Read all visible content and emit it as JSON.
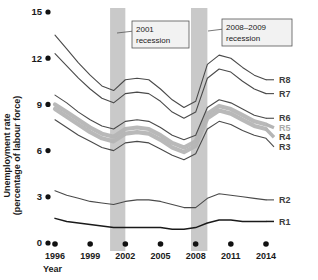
{
  "axes": {
    "y_title_line1": "Unemployment rate",
    "y_title_line2": "(percentage of labour force)",
    "x_title": "Year",
    "y_ticks": [
      "0",
      "3",
      "6",
      "9",
      "12",
      "15"
    ],
    "x_ticks": [
      "1996",
      "1999",
      "2002",
      "2005",
      "2008",
      "2011",
      "2014"
    ]
  },
  "annotations": [
    {
      "name": "recession-2001",
      "line1": "2001",
      "line2": "recession"
    },
    {
      "name": "recession-2008-2009",
      "line1": "2008–2009",
      "line2": "recession"
    }
  ],
  "series_labels": [
    "R8",
    "R7",
    "R6",
    "R5",
    "R4",
    "R3",
    "R2",
    "R1"
  ],
  "colors": {
    "recession_band": "#c9c9c9",
    "line_dark": "#4a4a4a",
    "line_darkest": "#1a1a1a",
    "band_light": "#b5b5b5",
    "annotation_box": "#f2f2f2",
    "text": "#1a1a1a"
  },
  "chart_data": {
    "type": "line",
    "title": "",
    "xlabel": "Year",
    "ylabel": "Unemployment rate (percentage of labour force)",
    "xlim": [
      1996,
      2014
    ],
    "ylim": [
      0,
      15
    ],
    "ytick_values": [
      0,
      3,
      6,
      9,
      12,
      15
    ],
    "xtick_values": [
      1996,
      1999,
      2002,
      2005,
      2008,
      2011,
      2014
    ],
    "grid": false,
    "legend_position": "right-inline",
    "x": [
      1996,
      1997,
      1998,
      1999,
      2000,
      2001,
      2002,
      2003,
      2004,
      2005,
      2006,
      2007,
      2008,
      2009,
      2010,
      2011,
      2012,
      2013,
      2014
    ],
    "series": [
      {
        "name": "R8",
        "style": "thin-line",
        "color": "#4a4a4a",
        "values": [
          13.5,
          12.6,
          11.7,
          10.9,
          10.2,
          9.9,
          10.6,
          10.7,
          10.6,
          10.0,
          9.3,
          8.8,
          9.2,
          11.6,
          12.2,
          12.0,
          11.4,
          10.9,
          10.6
        ]
      },
      {
        "name": "R7",
        "style": "thin-line",
        "color": "#4a4a4a",
        "values": [
          12.3,
          11.5,
          10.7,
          10.0,
          9.4,
          9.1,
          9.7,
          9.8,
          9.7,
          9.2,
          8.5,
          8.1,
          8.5,
          10.7,
          11.3,
          11.1,
          10.5,
          10.0,
          9.7
        ]
      },
      {
        "name": "R6",
        "style": "thin-line",
        "color": "#4a4a4a",
        "values": [
          9.6,
          9.1,
          8.5,
          8.0,
          7.6,
          7.4,
          7.9,
          8.0,
          7.9,
          7.5,
          7.0,
          6.7,
          7.0,
          8.8,
          9.3,
          9.1,
          8.7,
          8.3,
          8.1
        ]
      },
      {
        "name": "R5",
        "style": "thick-band",
        "color": "#b5b5b5",
        "values": [
          9.0,
          8.5,
          8.0,
          7.5,
          7.1,
          6.9,
          7.4,
          7.5,
          7.4,
          7.0,
          6.5,
          6.2,
          6.6,
          8.4,
          8.9,
          8.7,
          8.3,
          7.9,
          7.7
        ]
      },
      {
        "name": "R4",
        "style": "thick-band",
        "color": "#b5b5b5",
        "values": [
          8.7,
          8.2,
          7.7,
          7.2,
          6.8,
          6.6,
          7.1,
          7.2,
          7.1,
          6.7,
          6.2,
          5.9,
          6.3,
          8.1,
          8.6,
          8.4,
          8.0,
          7.6,
          7.4
        ]
      },
      {
        "name": "R3",
        "style": "thin-line",
        "color": "#4a4a4a",
        "values": [
          8.0,
          7.5,
          7.0,
          6.6,
          6.2,
          6.0,
          6.5,
          6.6,
          6.5,
          6.1,
          5.7,
          5.4,
          5.8,
          7.4,
          7.9,
          7.7,
          7.3,
          7.0,
          6.8
        ]
      },
      {
        "name": "R2",
        "style": "thin-line",
        "color": "#4a4a4a",
        "values": [
          3.4,
          3.1,
          2.9,
          2.7,
          2.6,
          2.5,
          2.7,
          2.8,
          2.8,
          2.7,
          2.5,
          2.3,
          2.3,
          2.9,
          3.2,
          3.1,
          3.0,
          2.9,
          2.8
        ]
      },
      {
        "name": "R1",
        "style": "thin-line-dark",
        "color": "#1a1a1a",
        "values": [
          1.6,
          1.4,
          1.3,
          1.2,
          1.1,
          1.0,
          1.0,
          1.0,
          1.0,
          1.0,
          0.9,
          0.9,
          1.0,
          1.3,
          1.5,
          1.5,
          1.4,
          1.4,
          1.4
        ]
      }
    ],
    "shaded_regions": [
      {
        "label": "2001 recession",
        "x_start": 2000.7,
        "x_end": 2002.0
      },
      {
        "label": "2008–2009 recession",
        "x_start": 2007.6,
        "x_end": 2009.0
      }
    ]
  }
}
